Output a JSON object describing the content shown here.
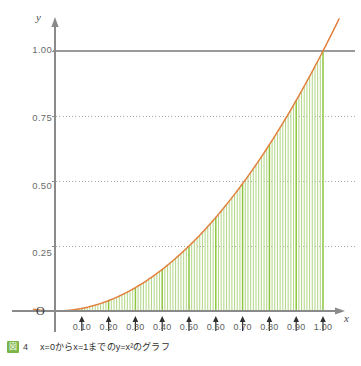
{
  "figure": {
    "caption_badge": "図",
    "caption_number": "4",
    "caption_text": "x=0からx=1までのy=x²のグラフ",
    "badge_color": "#7ab648"
  },
  "axes": {
    "x_name": "x",
    "y_name": "y",
    "origin_label": "O"
  },
  "chart_data": {
    "type": "area",
    "title": "",
    "subtitle": "",
    "xlabel": "x",
    "ylabel": "y",
    "xlim": [
      -0.08,
      1.06
    ],
    "ylim": [
      0,
      1.12
    ],
    "grid": true,
    "grid_style": "dotted horizontal at 0.25, 0.50, 0.75; solid at 1.00",
    "legend": null,
    "x_tick_labels": [
      "0.10",
      "0.20",
      "0.30",
      "0.40",
      "0.50",
      "0.60",
      "0.70",
      "0.80",
      "0.90",
      "1.00"
    ],
    "x_tick_values": [
      0.1,
      0.2,
      0.3,
      0.4,
      0.5,
      0.6,
      0.7,
      0.8,
      0.9,
      1.0
    ],
    "y_tick_labels": [
      "0.25",
      "0.50",
      "0.75",
      "1.00"
    ],
    "y_tick_values": [
      0.25,
      0.5,
      0.75,
      1.0
    ],
    "series": [
      {
        "name": "y = x^2",
        "type": "line",
        "color": "#e2803c",
        "x": [
          -0.08,
          -0.06,
          -0.04,
          -0.02,
          0.0,
          0.05,
          0.1,
          0.15,
          0.2,
          0.25,
          0.3,
          0.35,
          0.4,
          0.45,
          0.5,
          0.55,
          0.6,
          0.65,
          0.7,
          0.75,
          0.8,
          0.85,
          0.9,
          0.95,
          1.0,
          1.03,
          1.06
        ],
        "y": [
          0.0064,
          0.0036,
          0.0016,
          0.0004,
          0.0,
          0.0025,
          0.01,
          0.0225,
          0.04,
          0.0625,
          0.09,
          0.1225,
          0.16,
          0.2025,
          0.25,
          0.3025,
          0.36,
          0.4225,
          0.49,
          0.5625,
          0.64,
          0.7225,
          0.81,
          0.9025,
          1.0,
          1.0609,
          1.1236
        ]
      },
      {
        "name": "Riemann strips under y = x^2",
        "type": "vertical-strips",
        "color": "#b4d78a",
        "accent_color": "#8cc63f",
        "strip_count": 100,
        "x_start": 0.0,
        "x_end": 1.0,
        "accent_at": [
          0.1,
          0.2,
          0.3,
          0.4,
          0.5,
          0.6,
          0.7,
          0.8,
          0.9,
          1.0
        ],
        "description": "Thin vertical lines filling the region between the x-axis and the curve y=x^2 from x=0 to x=1"
      }
    ]
  },
  "colors": {
    "curve": "#e2803c",
    "strips": "#b4d78a",
    "strips_accent": "#8cc63f",
    "axis": "#8a8a8a",
    "gridline": "#9aa0a6",
    "tick_label": "#5d5d5d"
  }
}
